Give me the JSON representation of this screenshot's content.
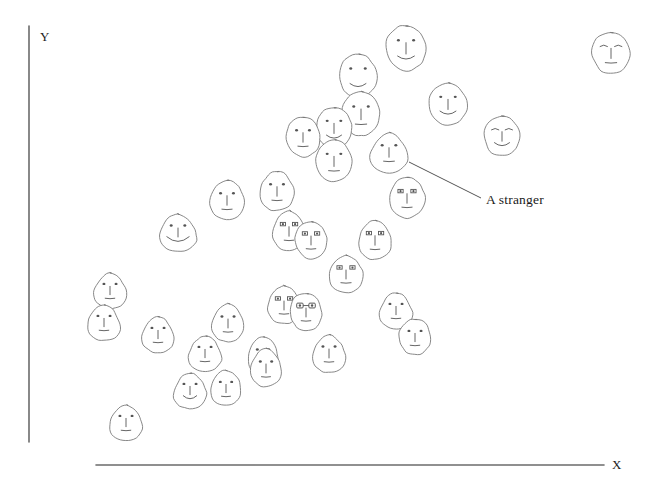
{
  "figure": {
    "background_color": "#ffffff",
    "axis_color": "#6b6b6b",
    "face_stroke_color": "#7a7a7a",
    "feature_stroke_color": "#555555",
    "text_color": "#1a1a1a"
  },
  "axes": {
    "y_label": "Y",
    "x_label": "X",
    "y_axis": {
      "x": 29,
      "y_top": 26,
      "y_bottom": 442
    },
    "x_axis": {
      "y": 465,
      "x_left": 96,
      "x_right": 604
    }
  },
  "annotation": {
    "label": "A stranger",
    "leader_line": {
      "x1": 409,
      "y1": 162,
      "x2": 481,
      "y2": 198
    },
    "points_to_face_index": 17
  },
  "chart_data": {
    "type": "scatter",
    "title": "",
    "xlabel": "X",
    "ylabel": "Y",
    "xlim": [
      96,
      604
    ],
    "ylim": [
      26,
      465
    ],
    "grid": false,
    "legend": null,
    "marker": "hand-drawn-face",
    "n_points": 40,
    "annotations": [
      {
        "text": "A stranger",
        "x": 488,
        "y": 200
      }
    ],
    "points": [
      {
        "x": 406,
        "y": 48,
        "rx": 20,
        "ry": 23,
        "shape": "round",
        "eyes": "dots",
        "mouth": "smile",
        "nose": true
      },
      {
        "x": 611,
        "y": 53,
        "rx": 19,
        "ry": 21,
        "shape": "round",
        "eyes": "brows",
        "mouth": "flat",
        "nose": true
      },
      {
        "x": 358,
        "y": 76,
        "rx": 19,
        "ry": 22,
        "shape": "round",
        "eyes": "dots",
        "mouth": "smile",
        "nose": false
      },
      {
        "x": 448,
        "y": 104,
        "rx": 19,
        "ry": 21,
        "shape": "round",
        "eyes": "dots",
        "mouth": "smile",
        "nose": true
      },
      {
        "x": 361,
        "y": 114,
        "rx": 19,
        "ry": 22,
        "shape": "round",
        "eyes": "dots",
        "mouth": "flat",
        "nose": true
      },
      {
        "x": 334,
        "y": 128,
        "rx": 18,
        "ry": 21,
        "shape": "round",
        "eyes": "dots",
        "mouth": "smile",
        "nose": true
      },
      {
        "x": 303,
        "y": 137,
        "rx": 17,
        "ry": 20,
        "shape": "round",
        "eyes": "dots",
        "mouth": "flat",
        "nose": true
      },
      {
        "x": 502,
        "y": 136,
        "rx": 18,
        "ry": 20,
        "shape": "round",
        "eyes": "brows",
        "mouth": "smile",
        "nose": true
      },
      {
        "x": 334,
        "y": 161,
        "rx": 18,
        "ry": 21,
        "shape": "round",
        "eyes": "dots",
        "mouth": "flat",
        "nose": true
      },
      {
        "x": 389,
        "y": 152,
        "rx": 18,
        "ry": 20,
        "shape": "potato",
        "eyes": "dots",
        "mouth": "flat",
        "nose": true
      },
      {
        "x": 277,
        "y": 191,
        "rx": 17,
        "ry": 20,
        "shape": "egg",
        "eyes": "dots",
        "mouth": "flat",
        "nose": true
      },
      {
        "x": 227,
        "y": 200,
        "rx": 17,
        "ry": 20,
        "shape": "egg",
        "eyes": "dots",
        "mouth": "flat",
        "nose": true
      },
      {
        "x": 407,
        "y": 198,
        "rx": 17,
        "ry": 20,
        "shape": "square",
        "eyes": "rects",
        "mouth": "flat",
        "nose": true
      },
      {
        "x": 178,
        "y": 232,
        "rx": 18,
        "ry": 19,
        "shape": "potato",
        "eyes": "dots",
        "mouth": "bigsmile",
        "nose": true
      },
      {
        "x": 289,
        "y": 231,
        "rx": 16,
        "ry": 20,
        "shape": "egg",
        "eyes": "rects",
        "mouth": "flat",
        "nose": true
      },
      {
        "x": 311,
        "y": 240,
        "rx": 16,
        "ry": 19,
        "shape": "round",
        "eyes": "rects",
        "mouth": "flat",
        "nose": true
      },
      {
        "x": 375,
        "y": 240,
        "rx": 16,
        "ry": 20,
        "shape": "egg",
        "eyes": "rects",
        "mouth": "flat",
        "nose": true
      },
      {
        "x": 346,
        "y": 274,
        "rx": 17,
        "ry": 19,
        "shape": "egg",
        "eyes": "rects",
        "mouth": "flat",
        "nose": true
      },
      {
        "x": 110,
        "y": 290,
        "rx": 16,
        "ry": 18,
        "shape": "potato",
        "eyes": "dots",
        "mouth": "flat",
        "nose": true
      },
      {
        "x": 284,
        "y": 305,
        "rx": 16,
        "ry": 19,
        "shape": "egg",
        "eyes": "rects",
        "mouth": "flat",
        "nose": true
      },
      {
        "x": 306,
        "y": 312,
        "rx": 16,
        "ry": 19,
        "shape": "round",
        "eyes": "glasses",
        "mouth": "flat",
        "nose": true
      },
      {
        "x": 396,
        "y": 310,
        "rx": 16,
        "ry": 18,
        "shape": "potato",
        "eyes": "dots",
        "mouth": "flat",
        "nose": true
      },
      {
        "x": 104,
        "y": 322,
        "rx": 16,
        "ry": 18,
        "shape": "potato",
        "eyes": "dots",
        "mouth": "flat",
        "nose": true
      },
      {
        "x": 158,
        "y": 334,
        "rx": 16,
        "ry": 18,
        "shape": "potato",
        "eyes": "dots",
        "mouth": "flat",
        "nose": true
      },
      {
        "x": 228,
        "y": 323,
        "rx": 16,
        "ry": 19,
        "shape": "egg",
        "eyes": "dots",
        "mouth": "flat",
        "nose": true
      },
      {
        "x": 415,
        "y": 337,
        "rx": 16,
        "ry": 18,
        "shape": "round",
        "eyes": "dots",
        "mouth": "flat",
        "nose": true
      },
      {
        "x": 205,
        "y": 353,
        "rx": 16,
        "ry": 18,
        "shape": "potato",
        "eyes": "dots",
        "mouth": "flat",
        "nose": true
      },
      {
        "x": 263,
        "y": 356,
        "rx": 15,
        "ry": 19,
        "shape": "egg",
        "eyes": "dots",
        "mouth": "flat",
        "nose": true
      },
      {
        "x": 329,
        "y": 353,
        "rx": 16,
        "ry": 19,
        "shape": "potato",
        "eyes": "dots",
        "mouth": "flat",
        "nose": true
      },
      {
        "x": 266,
        "y": 368,
        "rx": 15,
        "ry": 19,
        "shape": "egg",
        "eyes": "dots",
        "mouth": "flat",
        "nose": true
      },
      {
        "x": 190,
        "y": 390,
        "rx": 16,
        "ry": 18,
        "shape": "potato",
        "eyes": "dots",
        "mouth": "smile",
        "nose": true
      },
      {
        "x": 226,
        "y": 388,
        "rx": 15,
        "ry": 18,
        "shape": "egg",
        "eyes": "dots",
        "mouth": "flat",
        "nose": true
      },
      {
        "x": 126,
        "y": 422,
        "rx": 16,
        "ry": 18,
        "shape": "potato",
        "eyes": "dots",
        "mouth": "flat",
        "nose": true
      }
    ]
  }
}
